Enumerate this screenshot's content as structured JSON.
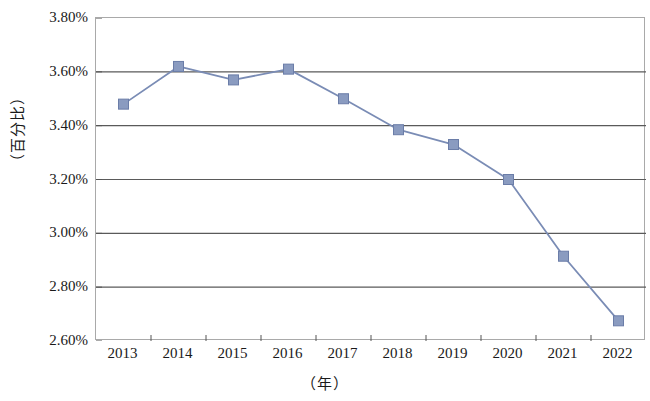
{
  "chart_data": {
    "type": "line",
    "title": "",
    "xlabel": "（年）",
    "ylabel": "（百分比）",
    "categories": [
      "2013",
      "2014",
      "2015",
      "2016",
      "2017",
      "2018",
      "2019",
      "2020",
      "2021",
      "2022"
    ],
    "values": [
      3.48,
      3.62,
      3.57,
      3.61,
      3.5,
      3.385,
      3.33,
      3.2,
      2.915,
      2.675
    ],
    "value_suffix": "%",
    "ylim": [
      2.6,
      3.8
    ],
    "ytick_step": 0.2,
    "ytick_labels": [
      "3.80%",
      "3.60%",
      "3.40%",
      "3.20%",
      "3.00%",
      "2.80%",
      "2.60%"
    ],
    "ytick_values": [
      3.8,
      3.6,
      3.4,
      3.2,
      3.0,
      2.8,
      2.6
    ],
    "grid": true,
    "grid_axis": "y",
    "legend": "none",
    "series": [
      {
        "name": "",
        "marker": "square",
        "line_color": "#7a8cb5",
        "marker_color": "#8a9bc0",
        "marker_edge_color": "#6b7da8",
        "values": [
          3.48,
          3.62,
          3.57,
          3.61,
          3.5,
          3.385,
          3.33,
          3.2,
          2.915,
          2.675
        ]
      }
    ],
    "colors": {
      "line": "#7a8cb5",
      "marker_fill": "#8a9bc0",
      "marker_edge": "#6b7da8",
      "gridline": "#5a5a5a",
      "axis": "#a9a9a9",
      "text": "#1a1a1a",
      "background": "#ffffff"
    }
  }
}
